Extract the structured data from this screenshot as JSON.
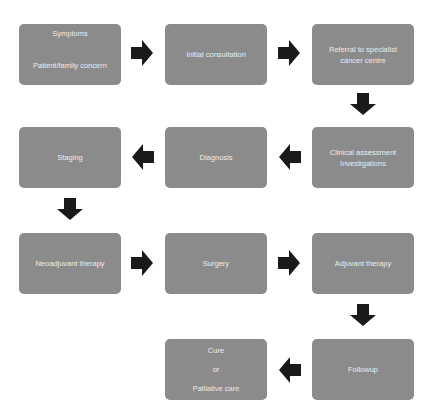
{
  "diagram": {
    "colors": {
      "box_fill": "#8b8b8b",
      "box_text": "#ececec",
      "arrow": "#1a1a1a",
      "background": "#ffffff"
    },
    "nodes": [
      {
        "id": "symptoms",
        "lines": [
          "Symptoms",
          "Patient/family concern"
        ]
      },
      {
        "id": "initial-consultation",
        "lines": [
          "Initial consultation"
        ]
      },
      {
        "id": "referral",
        "lines": [
          "Referral to specialist",
          "cancer centre"
        ]
      },
      {
        "id": "clinical-assessment",
        "lines": [
          "Clinical assessment",
          "Investigations"
        ]
      },
      {
        "id": "diagnosis",
        "lines": [
          "Diagnosis"
        ]
      },
      {
        "id": "staging",
        "lines": [
          "Staging"
        ]
      },
      {
        "id": "neoadjuvant-therapy",
        "lines": [
          "Neoadjuvant therapy"
        ]
      },
      {
        "id": "surgery",
        "lines": [
          "Surgery"
        ]
      },
      {
        "id": "adjuvant-therapy",
        "lines": [
          "Adjuvant therapy"
        ]
      },
      {
        "id": "followup",
        "lines": [
          "Followup"
        ]
      },
      {
        "id": "outcome",
        "lines": [
          "Cure",
          "or",
          "Palliative care"
        ]
      }
    ],
    "edges": [
      {
        "from": "symptoms",
        "to": "initial-consultation",
        "direction": "right"
      },
      {
        "from": "initial-consultation",
        "to": "referral",
        "direction": "right"
      },
      {
        "from": "referral",
        "to": "clinical-assessment",
        "direction": "down"
      },
      {
        "from": "clinical-assessment",
        "to": "diagnosis",
        "direction": "left"
      },
      {
        "from": "diagnosis",
        "to": "staging",
        "direction": "left"
      },
      {
        "from": "staging",
        "to": "neoadjuvant-therapy",
        "direction": "down"
      },
      {
        "from": "neoadjuvant-therapy",
        "to": "surgery",
        "direction": "right"
      },
      {
        "from": "surgery",
        "to": "adjuvant-therapy",
        "direction": "right"
      },
      {
        "from": "adjuvant-therapy",
        "to": "followup",
        "direction": "down"
      },
      {
        "from": "followup",
        "to": "outcome",
        "direction": "left"
      }
    ]
  }
}
